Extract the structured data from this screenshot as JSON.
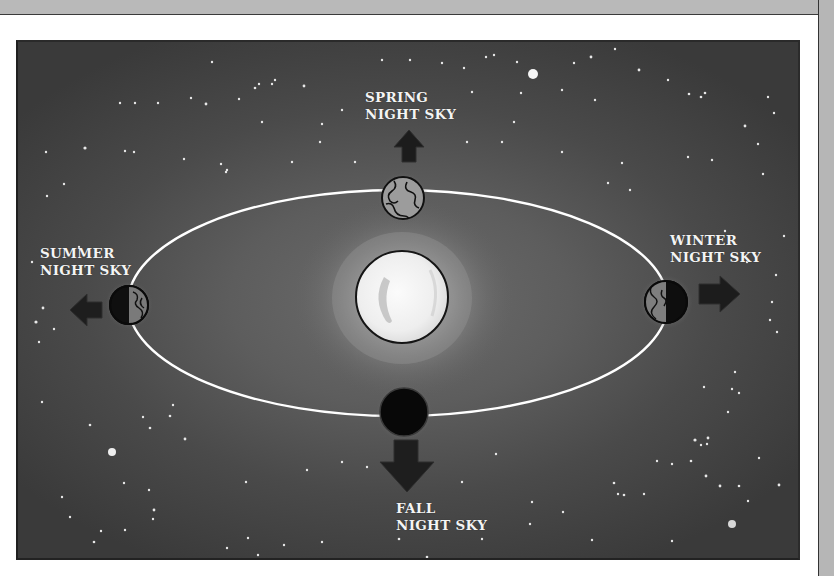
{
  "diagram": {
    "sun": {
      "name": "Sun",
      "position": "center"
    },
    "orbit": {
      "shape": "ellipse",
      "color": "#ffffff"
    },
    "seasons": [
      {
        "id": "spring",
        "line1": "SPRING",
        "line2": "NIGHT SKY",
        "arrow_direction": "up",
        "earth_position": "top"
      },
      {
        "id": "summer",
        "line1": "SUMMER",
        "line2": "NIGHT SKY",
        "arrow_direction": "left",
        "earth_position": "left"
      },
      {
        "id": "winter",
        "line1": "WINTER",
        "line2": "NIGHT SKY",
        "arrow_direction": "right",
        "earth_position": "right"
      },
      {
        "id": "fall",
        "line1": "FALL",
        "line2": "NIGHT SKY",
        "arrow_direction": "down",
        "earth_position": "bottom"
      }
    ],
    "colors": {
      "paper": "#ffffff",
      "frame": "#b9b9b9",
      "sky": "#4a4a4a",
      "sun": "#f2f2f2",
      "orbit": "#ffffff",
      "label": "#f4f4f4",
      "arrow": "#1e1e1e"
    }
  }
}
